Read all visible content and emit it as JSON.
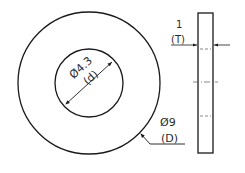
{
  "drawing": {
    "title": "Washer",
    "views": [
      "front-view",
      "side-view"
    ],
    "colors": {
      "line": "#1a1a1a",
      "text": "#2a2a2a",
      "background": "#ffffff"
    },
    "dimensions": {
      "inner_diameter": {
        "value": "Ø4.3",
        "symbol": "(d)"
      },
      "outer_diameter": {
        "value": "Ø9",
        "symbol": "(D)"
      },
      "thickness": {
        "value": "1",
        "symbol": "(T)"
      }
    }
  }
}
